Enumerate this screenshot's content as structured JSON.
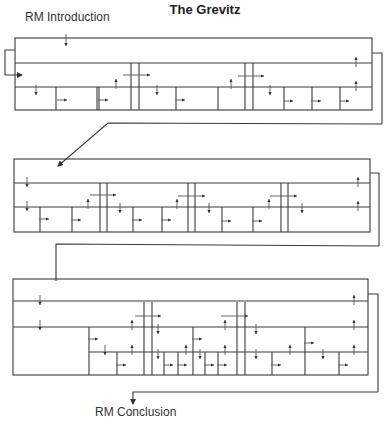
{
  "title": "The Grevitz",
  "labels": {
    "intro": "RM Introduction",
    "conclusion": "RM Conclusion"
  },
  "colors": {
    "line": "#3a3a3a",
    "background": "#ffffff"
  },
  "panels": [
    {
      "name": "panel-1",
      "box": [
        15,
        38,
        372,
        110
      ],
      "rows": [
        63,
        87
      ],
      "bracket": {
        "x": 382,
        "y1": 53,
        "y2": 124,
        "xin": 372
      },
      "verticals": [
        [
          97,
          87,
          110
        ],
        [
          131,
          63,
          110
        ],
        [
          139,
          63,
          110
        ],
        [
          245,
          63,
          110
        ],
        [
          253,
          63,
          110
        ],
        [
          56,
          87,
          110
        ],
        [
          99,
          87,
          110
        ],
        [
          176,
          87,
          110
        ],
        [
          218,
          87,
          110
        ],
        [
          284,
          87,
          110
        ],
        [
          312,
          87,
          110
        ],
        [
          340,
          87,
          110
        ]
      ],
      "arrows": [
        {
          "x": 66,
          "y": 40,
          "dir": "down",
          "len": 6
        },
        {
          "x": 36,
          "y": 90,
          "dir": "down"
        },
        {
          "x": 116,
          "y": 84,
          "dir": "up"
        },
        {
          "x": 157,
          "y": 90,
          "dir": "down"
        },
        {
          "x": 231,
          "y": 84,
          "dir": "up"
        },
        {
          "x": 270,
          "y": 90,
          "dir": "down"
        },
        {
          "x": 356,
          "y": 62,
          "dir": "up"
        },
        {
          "x": 356,
          "y": 86,
          "dir": "up"
        },
        {
          "x": 58,
          "y": 100,
          "dir": "right"
        },
        {
          "x": 99,
          "y": 100,
          "dir": "right"
        },
        {
          "x": 176,
          "y": 100,
          "dir": "right"
        },
        {
          "x": 284,
          "y": 101,
          "dir": "right"
        },
        {
          "x": 312,
          "y": 101,
          "dir": "right"
        },
        {
          "x": 340,
          "y": 101,
          "dir": "right"
        }
      ],
      "hArrows": [
        [
          123,
          75,
          150
        ],
        [
          238,
          76,
          264
        ]
      ]
    },
    {
      "name": "panel-2",
      "box": [
        14,
        159,
        370,
        232
      ],
      "rows": [
        183,
        207
      ],
      "bracket": {
        "x": 379,
        "y1": 173,
        "y2": 246,
        "xin": 370
      },
      "verticals": [
        [
          100,
          183,
          232
        ],
        [
          107,
          183,
          232
        ],
        [
          188,
          183,
          232
        ],
        [
          195,
          183,
          232
        ],
        [
          281,
          183,
          232
        ],
        [
          288,
          183,
          232
        ],
        [
          40,
          207,
          232
        ],
        [
          72,
          207,
          232
        ],
        [
          133,
          207,
          232
        ],
        [
          162,
          207,
          232
        ],
        [
          222,
          207,
          232
        ],
        [
          253,
          207,
          232
        ]
      ],
      "arrows": [
        {
          "x": 27,
          "y": 182,
          "dir": "down"
        },
        {
          "x": 27,
          "y": 206,
          "dir": "down"
        },
        {
          "x": 88,
          "y": 204,
          "dir": "up"
        },
        {
          "x": 120,
          "y": 208,
          "dir": "down"
        },
        {
          "x": 177,
          "y": 204,
          "dir": "up"
        },
        {
          "x": 209,
          "y": 208,
          "dir": "down"
        },
        {
          "x": 269,
          "y": 204,
          "dir": "up"
        },
        {
          "x": 302,
          "y": 208,
          "dir": "down"
        },
        {
          "x": 358,
          "y": 182,
          "dir": "up"
        },
        {
          "x": 358,
          "y": 206,
          "dir": "up"
        },
        {
          "x": 40,
          "y": 219,
          "dir": "right"
        },
        {
          "x": 72,
          "y": 220,
          "dir": "right"
        },
        {
          "x": 133,
          "y": 220,
          "dir": "right"
        },
        {
          "x": 162,
          "y": 220,
          "dir": "right"
        },
        {
          "x": 222,
          "y": 221,
          "dir": "right"
        },
        {
          "x": 253,
          "y": 221,
          "dir": "right"
        }
      ],
      "hArrows": [
        [
          90,
          195,
          116
        ],
        [
          178,
          196,
          205
        ],
        [
          270,
          196,
          297
        ]
      ]
    },
    {
      "name": "panel-3",
      "box": [
        13,
        279,
        368,
        375
      ],
      "rows": [
        301,
        327,
        352
      ],
      "bracket": {
        "x": 378,
        "y1": 294,
        "y2": 392,
        "xin": 368
      },
      "verticals": [
        [
          144,
          302,
          375
        ],
        [
          152,
          302,
          375
        ],
        [
          237,
          302,
          375
        ],
        [
          245,
          302,
          375
        ]
      ],
      "partialVerticals": [
        [
          89,
          327,
          375
        ],
        [
          117,
          352,
          375
        ],
        [
          164,
          352,
          375
        ],
        [
          178,
          352,
          375
        ],
        [
          193,
          327,
          375
        ],
        [
          205,
          352,
          375
        ],
        [
          218,
          352,
          375
        ],
        [
          272,
          352,
          375
        ],
        [
          305,
          327,
          375
        ],
        [
          339,
          352,
          375
        ]
      ],
      "rowSegments": [
        [
          13,
          301,
          368
        ],
        [
          13,
          327,
          368
        ],
        [
          89,
          352,
          368
        ]
      ],
      "arrows": [
        {
          "x": 40,
          "y": 300,
          "dir": "down"
        },
        {
          "x": 40,
          "y": 325,
          "dir": "down"
        },
        {
          "x": 105,
          "y": 350,
          "dir": "down"
        },
        {
          "x": 132,
          "y": 325,
          "dir": "up"
        },
        {
          "x": 132,
          "y": 350,
          "dir": "up"
        },
        {
          "x": 158,
          "y": 329,
          "dir": "down"
        },
        {
          "x": 158,
          "y": 354,
          "dir": "down"
        },
        {
          "x": 186,
          "y": 350,
          "dir": "up"
        },
        {
          "x": 200,
          "y": 354,
          "dir": "down"
        },
        {
          "x": 225,
          "y": 325,
          "dir": "up"
        },
        {
          "x": 225,
          "y": 350,
          "dir": "up"
        },
        {
          "x": 256,
          "y": 329,
          "dir": "down"
        },
        {
          "x": 256,
          "y": 354,
          "dir": "down"
        },
        {
          "x": 290,
          "y": 350,
          "dir": "up"
        },
        {
          "x": 323,
          "y": 354,
          "dir": "down"
        },
        {
          "x": 354,
          "y": 300,
          "dir": "up"
        },
        {
          "x": 354,
          "y": 325,
          "dir": "up"
        },
        {
          "x": 354,
          "y": 350,
          "dir": "up"
        },
        {
          "x": 89,
          "y": 339,
          "dir": "right"
        },
        {
          "x": 117,
          "y": 365,
          "dir": "right"
        },
        {
          "x": 164,
          "y": 365,
          "dir": "right"
        },
        {
          "x": 178,
          "y": 365,
          "dir": "right"
        },
        {
          "x": 193,
          "y": 339,
          "dir": "right"
        },
        {
          "x": 205,
          "y": 365,
          "dir": "right"
        },
        {
          "x": 218,
          "y": 365,
          "dir": "right"
        },
        {
          "x": 272,
          "y": 365,
          "dir": "right"
        },
        {
          "x": 305,
          "y": 343,
          "dir": "right"
        },
        {
          "x": 339,
          "y": 365,
          "dir": "right"
        }
      ],
      "hArrows": [
        [
          135,
          316,
          161
        ],
        [
          221,
          316,
          248
        ]
      ]
    }
  ],
  "connectors": [
    {
      "name": "loop-left",
      "points": [
        [
          15,
          50
        ],
        [
          5,
          50
        ],
        [
          5,
          75
        ],
        [
          22,
          75
        ]
      ],
      "arrowEnd": true
    },
    {
      "name": "p1-to-p2",
      "points": [
        [
          382,
          124
        ],
        [
          382,
          124
        ],
        [
          108,
          123
        ],
        [
          58,
          166
        ]
      ],
      "arrowEnd": true
    },
    {
      "name": "p2-to-p3",
      "points": [
        [
          379,
          246
        ],
        [
          56,
          244
        ],
        [
          56,
          281
        ]
      ],
      "arrowEnd": false
    },
    {
      "name": "p3-to-conclusion",
      "points": [
        [
          378,
          392
        ],
        [
          133,
          392
        ],
        [
          133,
          404
        ]
      ],
      "arrowEnd": true
    }
  ]
}
